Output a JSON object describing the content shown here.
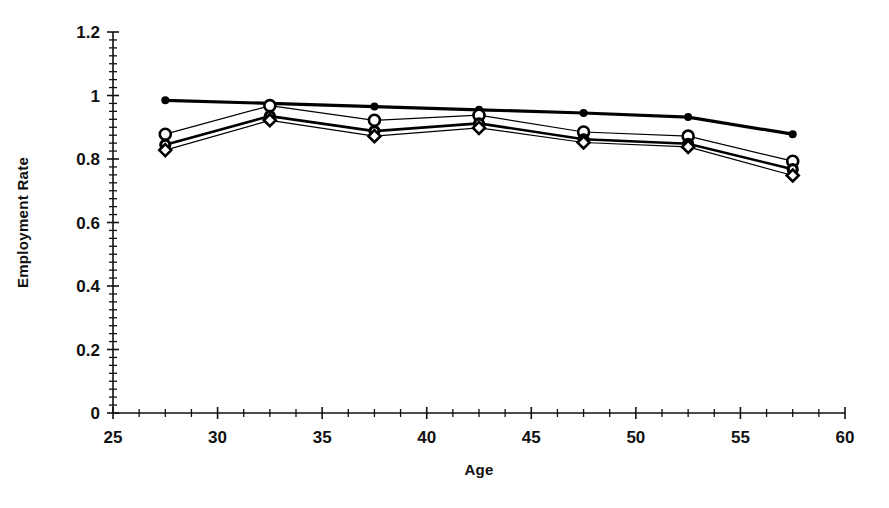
{
  "chart_data": {
    "type": "line",
    "title": "",
    "xlabel": "Age",
    "ylabel": "Employment Rate",
    "xlim": [
      25,
      60
    ],
    "ylim": [
      0,
      1.2
    ],
    "x_major_ticks": [
      25,
      30,
      35,
      40,
      45,
      50,
      55,
      60
    ],
    "x_minor_step": 1.25,
    "y_major_ticks": [
      0,
      0.2,
      0.4,
      0.6,
      0.8,
      1,
      1.2
    ],
    "y_minor_step": 0.025,
    "x_tick_labels": [
      "25",
      "30",
      "35",
      "40",
      "45",
      "50",
      "55",
      "60"
    ],
    "y_tick_labels": [
      "0",
      "0.2",
      "0.4",
      "0.6",
      "0.8",
      "1",
      "1.2"
    ],
    "grid": false,
    "legend": "none",
    "x": [
      27.5,
      32.5,
      37.5,
      42.5,
      47.5,
      52.5,
      57.5
    ],
    "categories": [
      "27.5",
      "32.5",
      "37.5",
      "42.5",
      "47.5",
      "52.5",
      "57.5"
    ],
    "series": [
      {
        "name": "Series 1",
        "marker": "filled-circle",
        "marker_size": 5,
        "line_width": 3.2,
        "color": "#000000",
        "values": [
          0.985,
          0.975,
          0.965,
          0.955,
          0.945,
          0.932,
          0.878
        ]
      },
      {
        "name": "Series 2",
        "marker": "open-circle",
        "marker_size": 8,
        "line_width": 1.2,
        "color": "#000000",
        "values": [
          0.878,
          0.968,
          0.922,
          0.938,
          0.885,
          0.872,
          0.793
        ]
      },
      {
        "name": "Series 3",
        "marker": "filled-circle-small",
        "marker_size": 6,
        "line_width": 2.6,
        "color": "#000000",
        "values": [
          0.845,
          0.935,
          0.888,
          0.912,
          0.862,
          0.848,
          0.768
        ]
      },
      {
        "name": "Series 4",
        "marker": "open-diamond",
        "marker_size": 7,
        "line_width": 1.2,
        "color": "#000000",
        "values": [
          0.828,
          0.922,
          0.872,
          0.898,
          0.852,
          0.838,
          0.748
        ]
      }
    ]
  },
  "axes": {
    "x_title": "Age",
    "y_title": "Employment Rate"
  }
}
